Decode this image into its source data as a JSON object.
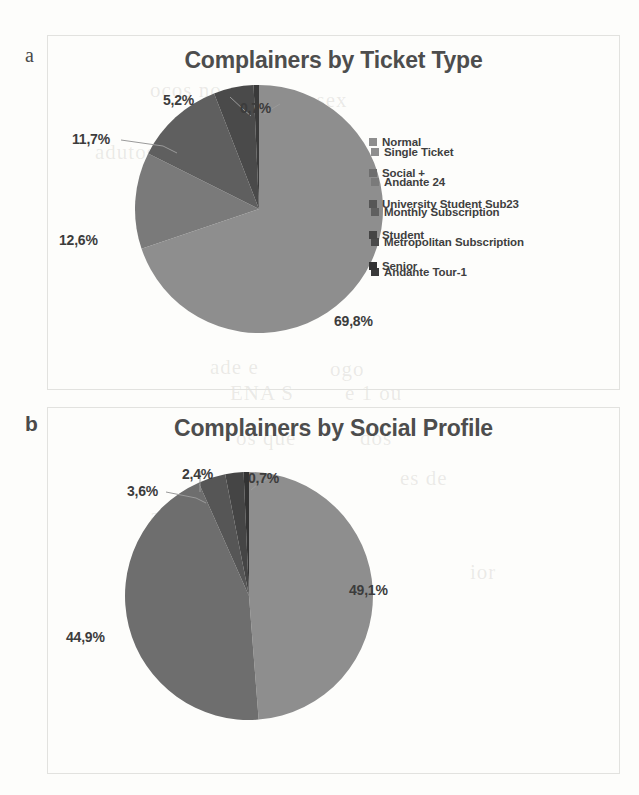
{
  "page": {
    "background_color": "#fdfdfb",
    "panel_border_color": "#e2e2df",
    "bleed_through_lines": [
      {
        "text": "ocos no",
        "x": 150,
        "y": 78
      },
      {
        "text": "a sex",
        "x": 300,
        "y": 88
      },
      {
        "text": "adutos",
        "x": 95,
        "y": 140
      },
      {
        "text": "tes",
        "x": 188,
        "y": 128
      },
      {
        "text": "ade e",
        "x": 210,
        "y": 355
      },
      {
        "text": "ogo",
        "x": 330,
        "y": 357
      },
      {
        "text": "ENA S",
        "x": 230,
        "y": 381
      },
      {
        "text": "e 1 ou",
        "x": 345,
        "y": 381
      },
      {
        "text": "os que",
        "x": 236,
        "y": 426
      },
      {
        "text": "dos",
        "x": 360,
        "y": 426
      },
      {
        "text": "ara",
        "x": 150,
        "y": 504
      },
      {
        "text": "a n",
        "x": 255,
        "y": 497
      },
      {
        "text": "es de",
        "x": 400,
        "y": 466
      },
      {
        "text": "ior",
        "x": 470,
        "y": 560
      }
    ]
  },
  "panels": [
    {
      "letter": "a",
      "title": "Complainers by Ticket Type",
      "chart_data": {
        "type": "pie",
        "title": "Complainers by Ticket Type",
        "xlabel": "",
        "ylabel": "",
        "legend_position": "right",
        "start_angle_deg": 0,
        "direction": "clockwise",
        "categories": [
          "Single Ticket",
          "Andante 24",
          "Monthly Subscription",
          "Metropolitan Subscription",
          "Andante Tour-1"
        ],
        "values": [
          69.8,
          12.6,
          11.7,
          5.2,
          0.7
        ],
        "value_labels": [
          "69,8%",
          "12,6%",
          "11,7%",
          "5,2%",
          "0,7%"
        ],
        "colors": [
          "#8e8e8e",
          "#7a7a7a",
          "#5f5f5f",
          "#4a4a4a",
          "#3a3a3a"
        ]
      },
      "labels": [
        {
          "text": "5,2%",
          "x": 163,
          "y": 92
        },
        {
          "text": "0,7%",
          "x": 240,
          "y": 100
        },
        {
          "text": "11,7%",
          "x": 72,
          "y": 131
        },
        {
          "text": "12,6%",
          "x": 59,
          "y": 232
        },
        {
          "text": "69,8%",
          "x": 334,
          "y": 313
        }
      ]
    },
    {
      "letter": "b",
      "title": "Complainers by Social Profile",
      "chart_data": {
        "type": "pie",
        "title": "Complainers by Social Profile",
        "xlabel": "",
        "ylabel": "",
        "legend_position": "right",
        "start_angle_deg": 0,
        "direction": "clockwise",
        "categories": [
          "Normal",
          "Social +",
          "University Student Sub23",
          "Student",
          "Senior"
        ],
        "values": [
          49.1,
          44.9,
          3.6,
          2.4,
          0.7
        ],
        "value_labels": [
          "49,1%",
          "44,9%",
          "3,6%",
          "2,4%",
          "0,7%"
        ],
        "colors": [
          "#8e8e8e",
          "#6e6e6e",
          "#565656",
          "#454545",
          "#333333"
        ]
      },
      "labels": [
        {
          "text": "2,4%",
          "x": 182,
          "y": 466
        },
        {
          "text": "0,7%",
          "x": 248,
          "y": 470
        },
        {
          "text": "3,6%",
          "x": 127,
          "y": 483
        },
        {
          "text": "49,1%",
          "x": 349,
          "y": 582
        },
        {
          "text": "44,9%",
          "x": 66,
          "y": 629
        }
      ]
    }
  ]
}
